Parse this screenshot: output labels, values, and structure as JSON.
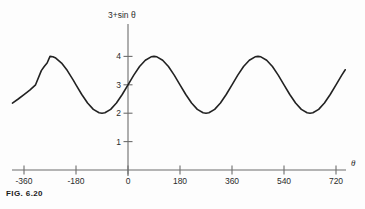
{
  "figure": {
    "caption": "FIG. 6.20"
  },
  "chart_data": {
    "type": "line",
    "title": "",
    "subtitle": "",
    "xlabel": "θ",
    "ylabel": "3+sin θ",
    "equation": "y = 3 + sin θ",
    "grid": false,
    "legend": null,
    "xlim": [
      -400,
      755
    ],
    "ylim": [
      0,
      4.6
    ],
    "xticks": [
      -360,
      -180,
      0,
      180,
      360,
      540,
      720
    ],
    "xtick_labels": [
      "-360",
      "-180",
      "0",
      "180",
      "360",
      "540",
      "720"
    ],
    "yticks": [
      1,
      2,
      3,
      4
    ],
    "ytick_labels": [
      "1",
      "2",
      "3",
      "4"
    ],
    "amplitude": 1,
    "vertical_shift": 3,
    "period": 360,
    "maxima": [
      {
        "x": -270,
        "y": 4
      },
      {
        "x": 90,
        "y": 4
      },
      {
        "x": 450,
        "y": 4
      }
    ],
    "minima": [
      {
        "x": -90,
        "y": 2
      },
      {
        "x": 270,
        "y": 2
      },
      {
        "x": 630,
        "y": 2
      }
    ],
    "series": [
      {
        "name": "3+sin θ",
        "color": "#222222",
        "x_start": -400,
        "x_end": 752,
        "points": [
          {
            "x": -400,
            "y": 2.357
          },
          {
            "x": -380,
            "y": 2.5
          },
          {
            "x": -360,
            "y": 2.653
          },
          {
            "x": -340,
            "y": 2.813
          },
          {
            "x": -320,
            "y": 3.0
          },
          {
            "x": -300,
            "y": 3.5
          },
          {
            "x": -290,
            "y": 3.643
          },
          {
            "x": -280,
            "y": 3.766
          },
          {
            "x": -270,
            "y": 4.0
          },
          {
            "x": -260,
            "y": 3.985
          },
          {
            "x": -250,
            "y": 3.94
          },
          {
            "x": -230,
            "y": 3.766
          },
          {
            "x": -210,
            "y": 3.5
          },
          {
            "x": -190,
            "y": 3.174
          },
          {
            "x": -180,
            "y": 3.0
          },
          {
            "x": -160,
            "y": 2.658
          },
          {
            "x": -140,
            "y": 2.357
          },
          {
            "x": -120,
            "y": 2.134
          },
          {
            "x": -100,
            "y": 2.015
          },
          {
            "x": -90,
            "y": 2.0
          },
          {
            "x": -80,
            "y": 2.015
          },
          {
            "x": -60,
            "y": 2.134
          },
          {
            "x": -40,
            "y": 2.357
          },
          {
            "x": -20,
            "y": 2.658
          },
          {
            "x": 0,
            "y": 3.0
          },
          {
            "x": 20,
            "y": 3.342
          },
          {
            "x": 40,
            "y": 3.643
          },
          {
            "x": 60,
            "y": 3.866
          },
          {
            "x": 80,
            "y": 3.985
          },
          {
            "x": 90,
            "y": 4.0
          },
          {
            "x": 100,
            "y": 3.985
          },
          {
            "x": 120,
            "y": 3.866
          },
          {
            "x": 140,
            "y": 3.643
          },
          {
            "x": 160,
            "y": 3.342
          },
          {
            "x": 180,
            "y": 3.0
          },
          {
            "x": 200,
            "y": 2.658
          },
          {
            "x": 220,
            "y": 2.357
          },
          {
            "x": 240,
            "y": 2.134
          },
          {
            "x": 260,
            "y": 2.015
          },
          {
            "x": 270,
            "y": 2.0
          },
          {
            "x": 280,
            "y": 2.015
          },
          {
            "x": 300,
            "y": 2.134
          },
          {
            "x": 320,
            "y": 2.357
          },
          {
            "x": 340,
            "y": 2.658
          },
          {
            "x": 360,
            "y": 3.0
          },
          {
            "x": 380,
            "y": 3.342
          },
          {
            "x": 400,
            "y": 3.643
          },
          {
            "x": 420,
            "y": 3.866
          },
          {
            "x": 440,
            "y": 3.985
          },
          {
            "x": 450,
            "y": 4.0
          },
          {
            "x": 460,
            "y": 3.985
          },
          {
            "x": 480,
            "y": 3.866
          },
          {
            "x": 500,
            "y": 3.643
          },
          {
            "x": 520,
            "y": 3.342
          },
          {
            "x": 540,
            "y": 3.0
          },
          {
            "x": 560,
            "y": 2.658
          },
          {
            "x": 580,
            "y": 2.357
          },
          {
            "x": 600,
            "y": 2.134
          },
          {
            "x": 620,
            "y": 2.015
          },
          {
            "x": 630,
            "y": 2.0
          },
          {
            "x": 640,
            "y": 2.015
          },
          {
            "x": 660,
            "y": 2.134
          },
          {
            "x": 680,
            "y": 2.357
          },
          {
            "x": 700,
            "y": 2.658
          },
          {
            "x": 720,
            "y": 3.0
          },
          {
            "x": 740,
            "y": 3.342
          },
          {
            "x": 752,
            "y": 3.53
          }
        ]
      }
    ]
  }
}
